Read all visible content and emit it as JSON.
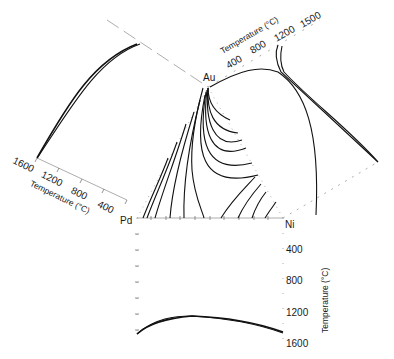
{
  "figure": {
    "type": "ternary-liquidus-projection-with-binary-foldouts",
    "system": "Au-Ni-Pd",
    "vertices": {
      "top": "Au",
      "left": "Pd",
      "right": "Ni"
    },
    "binary_panels": [
      {
        "name": "Pd-Au",
        "position": "upper-left",
        "axis_title": "Temperature (°C)",
        "tick_labels": [
          "1600",
          "1200",
          "800",
          "400"
        ]
      },
      {
        "name": "Au-Ni",
        "position": "upper-right",
        "axis_title": "Temperature (°C)",
        "tick_labels": [
          "400",
          "800",
          "1200",
          "1500"
        ]
      },
      {
        "name": "Pd-Ni",
        "position": "bottom",
        "axis_title": "Temperature (°C)",
        "tick_labels": [
          "400",
          "800",
          "1200",
          "1600"
        ]
      }
    ],
    "isotherm_count_left_group": 6,
    "isotherm_count_right_group": 8
  }
}
